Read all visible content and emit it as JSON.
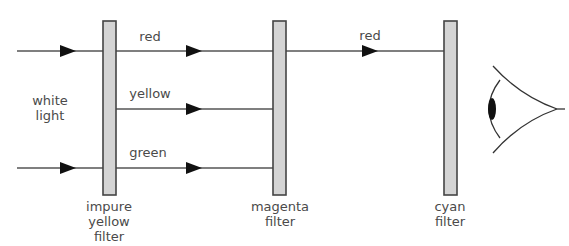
{
  "diagram": {
    "source_label": {
      "line1": "white",
      "line2": "light"
    },
    "filters": [
      {
        "id": "impure-yellow",
        "lines": [
          "impure",
          "yellow",
          "filter"
        ]
      },
      {
        "id": "magenta",
        "lines": [
          "magenta",
          "filter"
        ]
      },
      {
        "id": "cyan",
        "lines": [
          "cyan",
          "filter"
        ]
      }
    ],
    "stage1_rays": [
      {
        "label": "red"
      },
      {
        "label": "yellow"
      },
      {
        "label": "green"
      }
    ],
    "stage2_rays": [
      {
        "label": "red"
      }
    ],
    "colors": {
      "line": "#555555",
      "filter_fill": "#d4d4d4",
      "filter_stroke": "#444444",
      "arrow": "#111111",
      "text": "#4a4a4a"
    }
  }
}
